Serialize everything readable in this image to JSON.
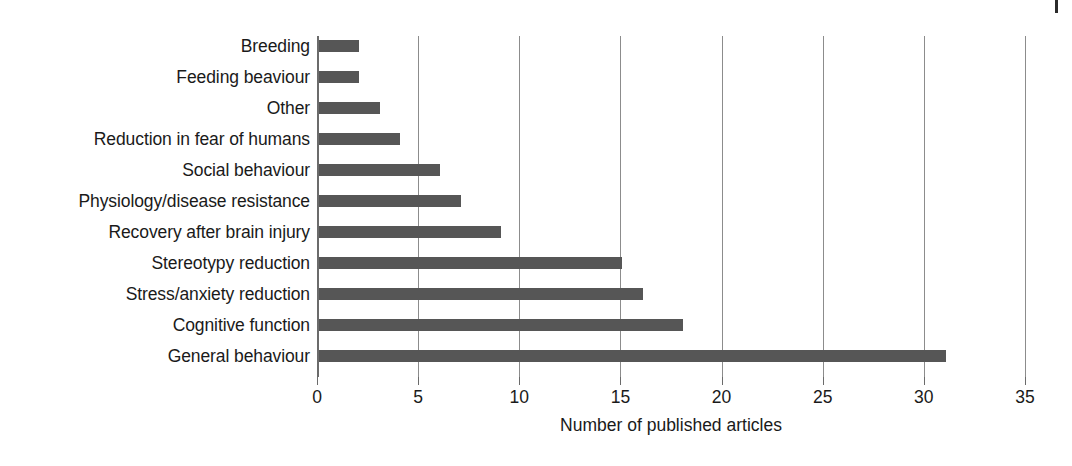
{
  "figure": {
    "background_color": "#ffffff",
    "bar_color": "#565656",
    "grid_color": "#8c8c8c",
    "axis_color": "#6b6b6b",
    "text_color": "#1a1a1a",
    "page_edge_mark": "page-edge-tick"
  },
  "chart_data": {
    "type": "bar",
    "orientation": "horizontal",
    "title": "",
    "subtitle": "",
    "xlabel": "Number of published articles",
    "ylabel": "",
    "xlim": [
      0,
      35
    ],
    "ylim": null,
    "grid": true,
    "grid_axis": "x",
    "legend": null,
    "legend_position": "none",
    "xticks": [
      0,
      5,
      10,
      15,
      20,
      25,
      30,
      35
    ],
    "xtick_labels": [
      "0",
      "5",
      "10",
      "15",
      "20",
      "25",
      "30",
      "35"
    ],
    "categories": [
      "Breeding",
      "Feeding beaviour",
      "Other",
      "Reduction in fear of humans",
      "Social behaviour",
      "Physiology/disease resistance",
      "Recovery after brain injury",
      "Stereotypy reduction",
      "Stress/anxiety reduction",
      "Cognitive function",
      "General behaviour"
    ],
    "values": [
      2,
      2,
      3,
      4,
      6,
      7,
      9,
      15,
      16,
      18,
      31
    ],
    "annotations": []
  }
}
